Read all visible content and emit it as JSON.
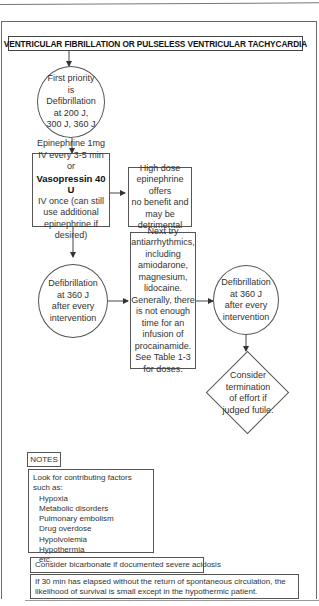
{
  "title": "VENTRICULAR FIBRILLATION OR PULSELESS VENTRICULAR TACHYCARDIA",
  "nodes": {
    "first_priority": {
      "lines": [
        "First priority",
        "is",
        "Defibrillation",
        "at 200 J,",
        "300 J, 360 J"
      ]
    },
    "epinephrine": {
      "line1": "Epinephrine 1mg",
      "line2": "IV every 3-5 min or",
      "bold": "Vasopressin 40 U",
      "line3": "IV once (can still",
      "line4": "use additional",
      "line5": "epinephrine if",
      "line6": "desired)"
    },
    "high_dose": {
      "lines": [
        "High dose",
        "epinephrine offers",
        "no benefit and",
        "may be",
        "detrimental"
      ]
    },
    "defib_1": {
      "lines": [
        "Defibrillation",
        "at 360 J",
        "after every",
        "intervention"
      ]
    },
    "antiarrhythmics": {
      "lines": [
        "Next try",
        "antiarrhythmics,",
        "including",
        "amiodarone,",
        "magnesium,",
        "lidocaine.",
        "Generally, there",
        "is not enough",
        "time for an",
        "infusion of",
        "procainamide.",
        "See Table 1-3",
        "for doses."
      ]
    },
    "defib_2": {
      "lines": [
        "Defibrillation",
        "at 360 J",
        "after every",
        "intervention"
      ]
    },
    "termination": {
      "lines": [
        "Consider",
        "termination",
        "of effort if",
        "judged futile."
      ]
    }
  },
  "notes": {
    "label": "NOTES",
    "intro": "Look for contributing factors such as:",
    "factors": [
      "Hypoxia",
      "Metabolic disorders",
      "Pulmonary embolism",
      "Drug overdose",
      "Hypolvolemia",
      "Hypothermia",
      "etc."
    ],
    "bicarbonate": "Consider bicarbonate if documented severe acidosis",
    "thirty_min": "If 30 min has elapsed without the return of spontaneous circulation, the likelihood of survival is small except in the hypothermic patient."
  }
}
